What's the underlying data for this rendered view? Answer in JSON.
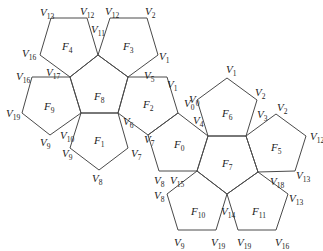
{
  "diagram": {
    "title": "",
    "stroke_color": "#4a4a4a",
    "faces": [
      {
        "id": "F0",
        "label": "F",
        "sub": "0",
        "points": [
          [
            178,
            113
          ],
          [
            208,
            136
          ],
          [
            197,
            171
          ],
          [
            159,
            171
          ],
          [
            148,
            135
          ]
        ],
        "lx": 174,
        "ly": 148
      },
      {
        "id": "F1",
        "label": "F",
        "sub": "1",
        "points": [
          [
            81,
            113
          ],
          [
            118,
            113
          ],
          [
            128,
            148
          ],
          [
            99,
            170
          ],
          [
            70,
            148
          ]
        ],
        "lx": 94,
        "ly": 144
      },
      {
        "id": "F2",
        "label": "F",
        "sub": "2",
        "points": [
          [
            128,
            77
          ],
          [
            167,
            77
          ],
          [
            178,
            113
          ],
          [
            148,
            135
          ],
          [
            118,
            113
          ]
        ],
        "lx": 143,
        "ly": 108
      },
      {
        "id": "F3",
        "label": "F",
        "sub": "3",
        "points": [
          [
            110,
            18
          ],
          [
            147,
            18
          ],
          [
            158,
            55
          ],
          [
            128,
            77
          ],
          [
            98,
            55
          ]
        ],
        "lx": 123,
        "ly": 50
      },
      {
        "id": "F4",
        "label": "F",
        "sub": "4",
        "points": [
          [
            51,
            18
          ],
          [
            87,
            18
          ],
          [
            98,
            55
          ],
          [
            70,
            77
          ],
          [
            40,
            55
          ]
        ],
        "lx": 62,
        "ly": 50
      },
      {
        "id": "F5",
        "label": "F",
        "sub": "5",
        "points": [
          [
            246,
            136
          ],
          [
            276,
            114
          ],
          [
            306,
            136
          ],
          [
            295,
            171
          ],
          [
            258,
            172
          ]
        ],
        "lx": 271,
        "ly": 151
      },
      {
        "id": "F6",
        "label": "F",
        "sub": "6",
        "points": [
          [
            197,
            100
          ],
          [
            227,
            78
          ],
          [
            257,
            100
          ],
          [
            246,
            136
          ],
          [
            208,
            136
          ]
        ],
        "lx": 222,
        "ly": 117
      },
      {
        "id": "F7",
        "label": "F",
        "sub": "7",
        "points": [
          [
            208,
            136
          ],
          [
            246,
            136
          ],
          [
            258,
            172
          ],
          [
            227,
            194
          ],
          [
            197,
            171
          ]
        ],
        "lx": 222,
        "ly": 167
      },
      {
        "id": "F8",
        "label": "F",
        "sub": "8",
        "points": [
          [
            70,
            77
          ],
          [
            98,
            55
          ],
          [
            128,
            77
          ],
          [
            118,
            113
          ],
          [
            81,
            113
          ]
        ],
        "lx": 94,
        "ly": 100
      },
      {
        "id": "F9",
        "label": "F",
        "sub": "9",
        "points": [
          [
            32,
            77
          ],
          [
            70,
            77
          ],
          [
            81,
            113
          ],
          [
            50,
            135
          ],
          [
            22,
            113
          ]
        ],
        "lx": 44,
        "ly": 110
      },
      {
        "id": "F10",
        "label": "F",
        "sub": "10",
        "points": [
          [
            167,
            194
          ],
          [
            197,
            171
          ],
          [
            227,
            194
          ],
          [
            216,
            230
          ],
          [
            178,
            230
          ]
        ],
        "lx": 191,
        "ly": 215
      },
      {
        "id": "F11",
        "label": "F",
        "sub": "11",
        "points": [
          [
            227,
            194
          ],
          [
            258,
            172
          ],
          [
            288,
            194
          ],
          [
            276,
            230
          ],
          [
            238,
            230
          ]
        ],
        "lx": 252,
        "ly": 215
      }
    ],
    "vertex_labels": [
      {
        "t": "V",
        "s": "13",
        "x": 40,
        "y": 16
      },
      {
        "t": "V",
        "s": "12",
        "x": 80,
        "y": 15
      },
      {
        "t": "V",
        "s": "12",
        "x": 105,
        "y": 15
      },
      {
        "t": "V",
        "s": "2",
        "x": 145,
        "y": 15
      },
      {
        "t": "V",
        "s": "11",
        "x": 91,
        "y": 33
      },
      {
        "t": "V",
        "s": "1",
        "x": 159,
        "y": 60
      },
      {
        "t": "V",
        "s": "16",
        "x": 22,
        "y": 57
      },
      {
        "t": "V",
        "s": "17",
        "x": 46,
        "y": 76
      },
      {
        "t": "V",
        "s": "5",
        "x": 144,
        "y": 79
      },
      {
        "t": "V",
        "s": "1",
        "x": 167,
        "y": 88
      },
      {
        "t": "V",
        "s": "16",
        "x": 16,
        "y": 80
      },
      {
        "t": "V",
        "s": "19",
        "x": 6,
        "y": 117
      },
      {
        "t": "V",
        "s": "0",
        "x": 184,
        "y": 107
      },
      {
        "t": "V",
        "s": "0",
        "x": 189,
        "y": 103
      },
      {
        "t": "V",
        "s": "4",
        "x": 193,
        "y": 124
      },
      {
        "t": "V",
        "s": "1",
        "x": 226,
        "y": 73
      },
      {
        "t": "V",
        "s": "2",
        "x": 255,
        "y": 96
      },
      {
        "t": "V",
        "s": "3",
        "x": 257,
        "y": 118
      },
      {
        "t": "V",
        "s": "2",
        "x": 277,
        "y": 111
      },
      {
        "t": "V",
        "s": "12",
        "x": 310,
        "y": 140
      },
      {
        "t": "V",
        "s": "9",
        "x": 40,
        "y": 146
      },
      {
        "t": "V",
        "s": "10",
        "x": 60,
        "y": 139
      },
      {
        "t": "V",
        "s": "6",
        "x": 123,
        "y": 125
      },
      {
        "t": "V",
        "s": "9",
        "x": 62,
        "y": 157
      },
      {
        "t": "V",
        "s": "7",
        "x": 131,
        "y": 157
      },
      {
        "t": "V",
        "s": "7",
        "x": 144,
        "y": 143
      },
      {
        "t": "V",
        "s": "8",
        "x": 92,
        "y": 182
      },
      {
        "t": "V",
        "s": "8",
        "x": 154,
        "y": 184
      },
      {
        "t": "V",
        "s": "15",
        "x": 170,
        "y": 184
      },
      {
        "t": "V",
        "s": "8",
        "x": 154,
        "y": 199
      },
      {
        "t": "V",
        "s": "18",
        "x": 270,
        "y": 185
      },
      {
        "t": "V",
        "s": "13",
        "x": 296,
        "y": 179
      },
      {
        "t": "V",
        "s": "13",
        "x": 289,
        "y": 202
      },
      {
        "t": "V",
        "s": "14",
        "x": 221,
        "y": 215
      },
      {
        "t": "V",
        "s": "9",
        "x": 174,
        "y": 246
      },
      {
        "t": "V",
        "s": "19",
        "x": 211,
        "y": 246
      },
      {
        "t": "V",
        "s": "19",
        "x": 237,
        "y": 246
      },
      {
        "t": "V",
        "s": "16",
        "x": 275,
        "y": 246
      }
    ]
  }
}
